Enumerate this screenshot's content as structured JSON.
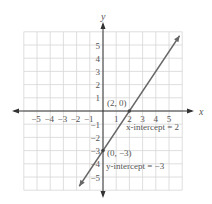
{
  "chart_data": {
    "type": "line",
    "title": "",
    "xlabel": "x",
    "ylabel": "y",
    "xlim": [
      -6,
      6
    ],
    "ylim": [
      -6,
      6
    ],
    "grid": true,
    "x_ticks": [
      "-5",
      "-4",
      "-3",
      "-2",
      "-1",
      "1",
      "2",
      "3",
      "4",
      "5"
    ],
    "y_ticks": [
      "5",
      "4",
      "3",
      "2",
      "1",
      "-1",
      "-2",
      "-3",
      "-4",
      "-5"
    ],
    "series": [
      {
        "name": "line",
        "equation": "y = 1.5x - 3",
        "slope": 1.5,
        "intercept": -3,
        "x": [
          -1.8,
          5.8
        ],
        "y": [
          -5.7,
          5.7
        ],
        "color": "#666666"
      }
    ],
    "points": [
      {
        "x": 2,
        "y": 0,
        "label": "(2, 0)"
      },
      {
        "x": 0,
        "y": -3,
        "label": "(0, −3)"
      }
    ],
    "annotations": [
      {
        "text": "x-intercept = 2"
      },
      {
        "text": "y-intercept = −3"
      }
    ]
  },
  "labels": {
    "x_axis": "x",
    "y_axis": "y",
    "point_a": "(2, 0)",
    "point_b": "(0, −3)",
    "x_intercept": "x-intercept = 2",
    "y_intercept": "y-intercept = −3"
  }
}
